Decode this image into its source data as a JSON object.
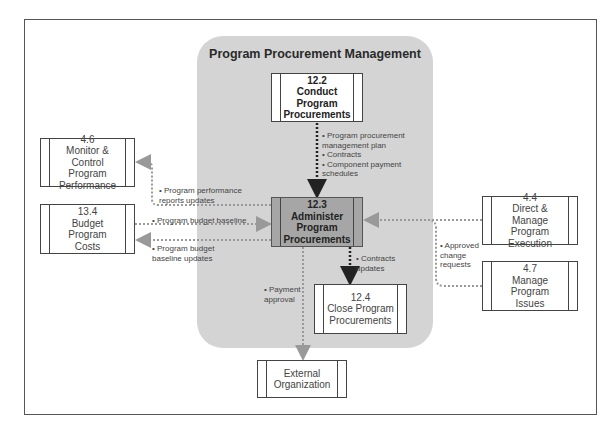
{
  "region": {
    "title": "Program Procurement Management",
    "color": "#d4d4d4"
  },
  "processes": {
    "p122": {
      "number": "12.2",
      "name": "Conduct\nProgram\nProcurements"
    },
    "p123": {
      "number": "12.3",
      "name": "Administer\nProgram\nProcurements"
    },
    "p124": {
      "number": "12.4",
      "name": "Close Program\nProcurements"
    },
    "p46": {
      "number": "4.6",
      "name": "Monitor &\nControl Program\nPerformance"
    },
    "p134": {
      "number": "13.4",
      "name": "Budget Program\nCosts"
    },
    "p44": {
      "number": "4.4",
      "name": "Direct &\nManage Program\nExecution"
    },
    "p47": {
      "number": "4.7",
      "name": "Manage Program\nIssues"
    },
    "external": {
      "number": "",
      "name": "External\nOrganization"
    }
  },
  "flows": {
    "from122": "• Program procurement\n  management plan\n• Contracts\n• Component payment\n  schedules",
    "to46": "• Program performance\n  reports updates",
    "from134": "• Program budget baseline",
    "to134": "• Program budget\n  baseline updates",
    "to124": "• Contracts\n  updates",
    "toExternal": "• Payment\n  approval",
    "from44_47": "• Approved\n  change\n  requests"
  },
  "colors": {
    "darkArrow": "#222222",
    "grayArrow": "#999999",
    "highlightBox": "#a6a6a6"
  }
}
